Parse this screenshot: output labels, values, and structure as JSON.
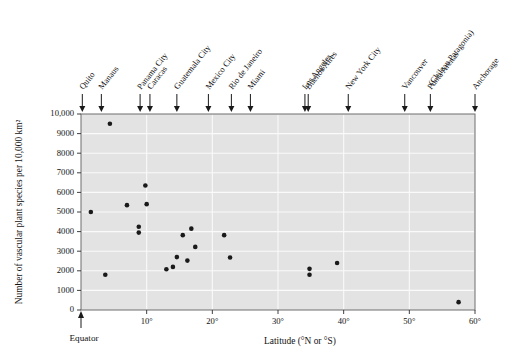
{
  "chart_data": {
    "type": "scatter",
    "title": "",
    "xlabel": "Latitude (°N or °S)",
    "ylabel": "Number of vascular plant species per 10,000 km²",
    "xlim": [
      0,
      60
    ],
    "ylim": [
      0,
      10000
    ],
    "grid": true,
    "legend": "none",
    "origin_annotation": "Equator",
    "xticks": [
      {
        "value": 10,
        "label": "10°"
      },
      {
        "value": 20,
        "label": "20°"
      },
      {
        "value": 30,
        "label": "30°"
      },
      {
        "value": 40,
        "label": "40°"
      },
      {
        "value": 50,
        "label": "50°"
      },
      {
        "value": 60,
        "label": "60°"
      }
    ],
    "yticks": [
      {
        "value": 0,
        "label": "0"
      },
      {
        "value": 1000,
        "label": "1000"
      },
      {
        "value": 2000,
        "label": "2000"
      },
      {
        "value": 3000,
        "label": "3000"
      },
      {
        "value": 4000,
        "label": "4000"
      },
      {
        "value": 5000,
        "label": "5000"
      },
      {
        "value": 6000,
        "label": "6000"
      },
      {
        "value": 7000,
        "label": "7000"
      },
      {
        "value": 8000,
        "label": "8000"
      },
      {
        "value": 9000,
        "label": "9000"
      },
      {
        "value": 10000,
        "label": "10,000"
      }
    ],
    "city_markers": [
      {
        "label": "Quito",
        "latitude": 0.2
      },
      {
        "label": "Manaus",
        "latitude": 3.1
      },
      {
        "label": "Panama City",
        "latitude": 9.0
      },
      {
        "label": "Caracas",
        "latitude": 10.5
      },
      {
        "label": "Guatemala City",
        "latitude": 14.6
      },
      {
        "label": "Mexico City",
        "latitude": 19.4
      },
      {
        "label": "Rio de Janeiro",
        "latitude": 22.9
      },
      {
        "label": "Miami",
        "latitude": 25.8
      },
      {
        "label": "Buenos Aires",
        "latitude": 34.6
      },
      {
        "label": "Los Angeles",
        "latitude": 34.1
      },
      {
        "label": "New York City",
        "latitude": 40.7
      },
      {
        "label": "Vancouver",
        "latitude": 49.3
      },
      {
        "label": "Punta Arenas",
        "latitude": 53.2
      },
      {
        "label": "(Chilean Patagonia)",
        "latitude": 53.2
      },
      {
        "label": "Anchorage",
        "latitude": 61.2
      }
    ],
    "points": [
      {
        "x": 1.5,
        "y": 5000
      },
      {
        "x": 4.4,
        "y": 9500
      },
      {
        "x": 3.7,
        "y": 1800
      },
      {
        "x": 7.0,
        "y": 5350
      },
      {
        "x": 9.8,
        "y": 6350
      },
      {
        "x": 10.0,
        "y": 5400
      },
      {
        "x": 8.8,
        "y": 4250
      },
      {
        "x": 8.8,
        "y": 3950
      },
      {
        "x": 13.0,
        "y": 2080
      },
      {
        "x": 14.0,
        "y": 2200
      },
      {
        "x": 14.6,
        "y": 2700
      },
      {
        "x": 15.5,
        "y": 3820
      },
      {
        "x": 16.8,
        "y": 4150
      },
      {
        "x": 16.2,
        "y": 2520
      },
      {
        "x": 17.4,
        "y": 3220
      },
      {
        "x": 21.8,
        "y": 3820
      },
      {
        "x": 22.7,
        "y": 2680
      },
      {
        "x": 34.8,
        "y": 2100
      },
      {
        "x": 34.8,
        "y": 1800
      },
      {
        "x": 39.0,
        "y": 2400
      },
      {
        "x": 57.5,
        "y": 400
      }
    ]
  },
  "figure": {
    "name": "latitudinal-species-richness-scatter"
  }
}
